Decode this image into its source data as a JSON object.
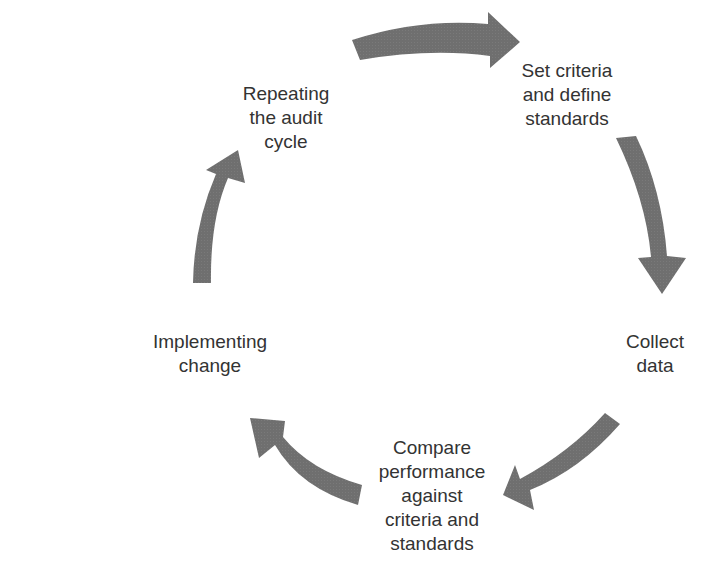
{
  "diagram": {
    "type": "cycle",
    "arrow_color": "#6f6f6f",
    "text_color": "#333333",
    "steps": [
      {
        "label": "Set criteria\nand define\nstandards"
      },
      {
        "label": "Collect\ndata"
      },
      {
        "label": "Compare\nperformance\nagainst\ncriteria and\nstandards"
      },
      {
        "label": "Implementing\nchange"
      },
      {
        "label": "Repeating\nthe audit\ncycle"
      }
    ]
  }
}
